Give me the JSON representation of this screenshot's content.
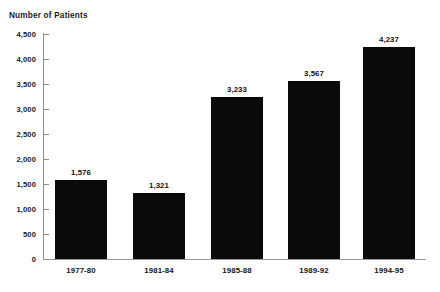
{
  "chart_data": {
    "type": "bar",
    "title": "Number of Patients",
    "xlabel": "",
    "ylabel": "Number of Patients",
    "categories": [
      "1977-80",
      "1981-84",
      "1985-88",
      "1989-92",
      "1994-95"
    ],
    "values": [
      1576,
      1321,
      3233,
      3567,
      4237
    ],
    "value_labels": [
      "1,576",
      "1,321",
      "3,233",
      "3,567",
      "4,237"
    ],
    "ylim": [
      0,
      4500
    ],
    "ytick_values": [
      0,
      500,
      1000,
      1500,
      2000,
      2500,
      3000,
      3500,
      4000,
      4500
    ],
    "ytick_labels": [
      "0",
      "500",
      "1,000",
      "1,500",
      "2,000",
      "2,500",
      "3,000",
      "3,500",
      "4,000",
      "4,500"
    ],
    "grid": false,
    "legend": false,
    "legend_position": "none",
    "series": [
      {
        "name": "Number of Patients",
        "values": [
          1576,
          1321,
          3233,
          3567,
          4237
        ]
      }
    ],
    "bar_color": "#0a0a0a",
    "axis_color": "#8c8c8c",
    "background_color": "#ffffff",
    "text_color": "#1a1a1a"
  }
}
